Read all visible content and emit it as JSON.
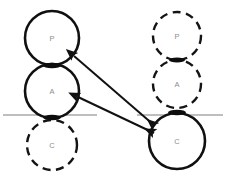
{
  "figure": {
    "background_color": "#ffffff",
    "width": 227,
    "height": 178
  },
  "colors": {
    "stroke_solid": "#101010",
    "stroke_dashed": "#141414",
    "label_text": "#8d8d8d",
    "reference_line": "#a8a8a8",
    "arrow": "#111111",
    "background": "#ffffff"
  },
  "groups": [
    {
      "id": "left-column",
      "name": "left-stack",
      "center_x": 52,
      "nodes": [
        {
          "id": "left-p",
          "label": "P",
          "cx": 52,
          "cy": 38,
          "r": 27,
          "style": "solid",
          "stroke_width": 2.6
        },
        {
          "id": "left-a",
          "label": "A",
          "cx": 52,
          "cy": 91,
          "r": 27,
          "style": "solid",
          "stroke_width": 2.6
        },
        {
          "id": "left-c",
          "label": "C",
          "cx": 52,
          "cy": 145,
          "r": 25,
          "style": "dashed",
          "stroke_width": 2.4
        }
      ]
    },
    {
      "id": "right-column",
      "name": "right-stack",
      "center_x": 177,
      "nodes": [
        {
          "id": "right-p",
          "label": "P",
          "cx": 177,
          "cy": 36,
          "r": 24,
          "style": "dashed",
          "stroke_width": 2.4
        },
        {
          "id": "right-a",
          "label": "A",
          "cx": 177,
          "cy": 84,
          "r": 24,
          "style": "dashed",
          "stroke_width": 2.4
        },
        {
          "id": "right-c",
          "label": "C",
          "cx": 177,
          "cy": 141,
          "r": 28,
          "style": "solid",
          "stroke_width": 2.6
        }
      ]
    }
  ],
  "reference_lines": [
    {
      "id": "left-reference-line",
      "x1": 3,
      "y1": 115,
      "x2": 97,
      "y2": 115,
      "width": 1.6
    },
    {
      "id": "right-reference-line",
      "x1": 137,
      "y1": 115,
      "x2": 223,
      "y2": 115,
      "width": 1.6
    }
  ],
  "junctions": [
    {
      "id": "left-p-a-junction",
      "cx": 52,
      "cy": 65,
      "rx": 9,
      "ry": 2.6
    },
    {
      "id": "left-a-c-junction",
      "cx": 52,
      "cy": 117,
      "rx": 9,
      "ry": 2.6
    },
    {
      "id": "right-p-a-junction",
      "cx": 177,
      "cy": 60,
      "rx": 8,
      "ry": 2.4
    },
    {
      "id": "right-a-c-junction",
      "cx": 177,
      "cy": 112,
      "rx": 9,
      "ry": 2.6
    }
  ],
  "arrows": [
    {
      "id": "arrow-p-to-c",
      "name": "arrow-left-p-right-c",
      "from": "left-p",
      "to": "right-c",
      "x1": 74,
      "y1": 56,
      "x2": 155,
      "y2": 126,
      "double_headed": true,
      "width": 2.0
    },
    {
      "id": "arrow-a-to-c",
      "name": "arrow-left-a-right-c",
      "from": "left-a",
      "to": "right-c",
      "x1": 78,
      "y1": 97,
      "x2": 154,
      "y2": 133,
      "double_headed": true,
      "width": 2.0
    }
  ]
}
